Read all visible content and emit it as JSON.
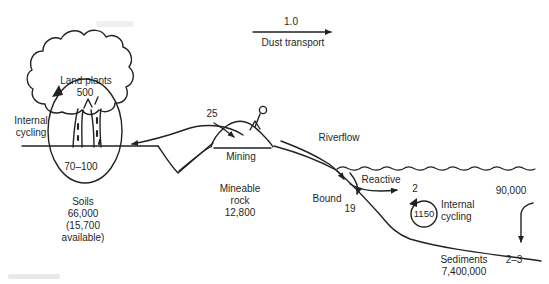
{
  "figure": {
    "background": "#ffffff",
    "ink": "#222222",
    "atmosphere": {
      "dust_flux_value": "1.0",
      "dust_flux_label": "Dust transport"
    },
    "land": {
      "plants_label": "Land plants",
      "plants_stock": "500",
      "internal_cycling_lines": [
        "Internal",
        "cycling"
      ],
      "uptake_flux": "70–100",
      "soils_lines": [
        "Soils",
        "66,000",
        "(15,700",
        "available)"
      ]
    },
    "mining": {
      "flux": "25",
      "label": "Mining",
      "rock_lines": [
        "Mineable",
        "rock",
        "12,800"
      ]
    },
    "ocean": {
      "riverflow_label": "Riverflow",
      "reactive_label": "Reactive",
      "reactive_value": "2",
      "bound_label": "Bound",
      "bound_value": "19",
      "internal_cycling_value": "1150",
      "internal_cycling_lines": [
        "Internal",
        "cycling"
      ],
      "surface_stock": "90,000",
      "burial_flux": "2–3",
      "sediments_lines": [
        "Sediments",
        "7,400,000"
      ]
    }
  }
}
